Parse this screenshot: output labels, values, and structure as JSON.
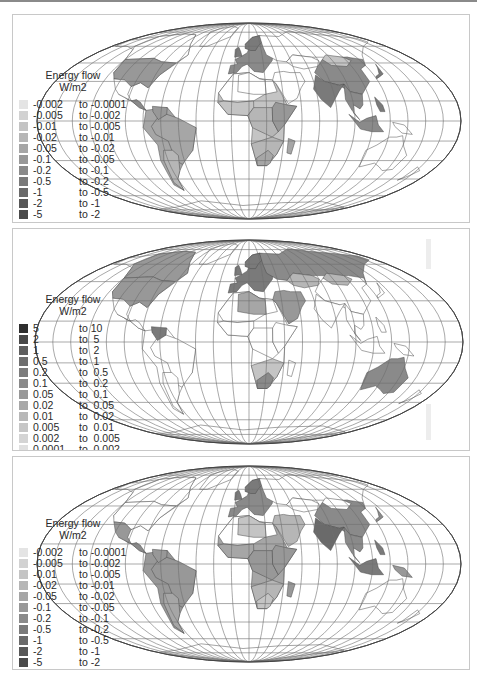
{
  "figure": {
    "panels": [
      {
        "id": "panel-1",
        "legend": {
          "title_line1": "Energy flow",
          "title_line2": "W/m2",
          "items": [
            {
              "lo": "-0.002",
              "hi": "to -0.0001",
              "color": "#e4e4e4"
            },
            {
              "lo": "-0.005",
              "hi": "to -0.002",
              "color": "#d2d2d2"
            },
            {
              "lo": "-0.01",
              "hi": "to -0.005",
              "color": "#c4c4c4"
            },
            {
              "lo": "-0.02",
              "hi": "to -0.01",
              "color": "#b6b6b6"
            },
            {
              "lo": "-0.05",
              "hi": "to -0.02",
              "color": "#a6a6a6"
            },
            {
              "lo": "-0.1",
              "hi": "to -0.05",
              "color": "#989898"
            },
            {
              "lo": "-0.2",
              "hi": "to -0.1",
              "color": "#8a8a8a"
            },
            {
              "lo": "-0.5",
              "hi": "to -0.2",
              "color": "#7a7a7a"
            },
            {
              "lo": "-1",
              "hi": "to -0.5",
              "color": "#6a6a6a"
            },
            {
              "lo": "-2",
              "hi": "to -1",
              "color": "#585858"
            },
            {
              "lo": "-5",
              "hi": "to -2",
              "color": "#4a4a4a"
            }
          ]
        }
      },
      {
        "id": "panel-2",
        "legend": {
          "title_line1": "Energy flow",
          "title_line2": "W/m2",
          "items": [
            {
              "lo": "5",
              "hi": "to 10",
              "color": "#2e2e2e"
            },
            {
              "lo": "2",
              "hi": "to  5",
              "color": "#484848"
            },
            {
              "lo": "1",
              "hi": "to  2",
              "color": "#5e5e5e"
            },
            {
              "lo": "0.5",
              "hi": "to  1",
              "color": "#6e6e6e"
            },
            {
              "lo": "0.2",
              "hi": "to  0.5",
              "color": "#7c7c7c"
            },
            {
              "lo": "0.1",
              "hi": "to  0.2",
              "color": "#8a8a8a"
            },
            {
              "lo": "0.05",
              "hi": "to  0.1",
              "color": "#989898"
            },
            {
              "lo": "0.02",
              "hi": "to  0.05",
              "color": "#a8a8a8"
            },
            {
              "lo": "0.01",
              "hi": "to  0.02",
              "color": "#b8b8b8"
            },
            {
              "lo": "0.005",
              "hi": "to  0.01",
              "color": "#c6c6c6"
            },
            {
              "lo": "0.002",
              "hi": "to  0.005",
              "color": "#d4d4d4"
            },
            {
              "lo": "0.0001",
              "hi": "to  0.002",
              "color": "#e0e0e0"
            }
          ]
        }
      },
      {
        "id": "panel-3",
        "legend": {
          "title_line1": "Energy flow",
          "title_line2": "W/m2",
          "items": [
            {
              "lo": "-0.002",
              "hi": "to -0.0001",
              "color": "#e4e4e4"
            },
            {
              "lo": "-0.005",
              "hi": "to -0.002",
              "color": "#d2d2d2"
            },
            {
              "lo": "-0.01",
              "hi": "to -0.005",
              "color": "#c4c4c4"
            },
            {
              "lo": "-0.02",
              "hi": "to -0.01",
              "color": "#b6b6b6"
            },
            {
              "lo": "-0.05",
              "hi": "to -0.02",
              "color": "#a6a6a6"
            },
            {
              "lo": "-0.1",
              "hi": "to -0.05",
              "color": "#989898"
            },
            {
              "lo": "-0.2",
              "hi": "to -0.1",
              "color": "#8a8a8a"
            },
            {
              "lo": "-0.5",
              "hi": "to -0.2",
              "color": "#7a7a7a"
            },
            {
              "lo": "-1",
              "hi": "to -0.5",
              "color": "#6a6a6a"
            },
            {
              "lo": "-2",
              "hi": "to -1",
              "color": "#585858"
            },
            {
              "lo": "-5",
              "hi": "to -2",
              "color": "#4a4a4a"
            }
          ]
        }
      }
    ],
    "map_style": {
      "projection": "Mollweide",
      "graticule_color": "#6e6e6e",
      "border_color": "#4a4a4a",
      "ocean_color": "#ffffff"
    }
  }
}
